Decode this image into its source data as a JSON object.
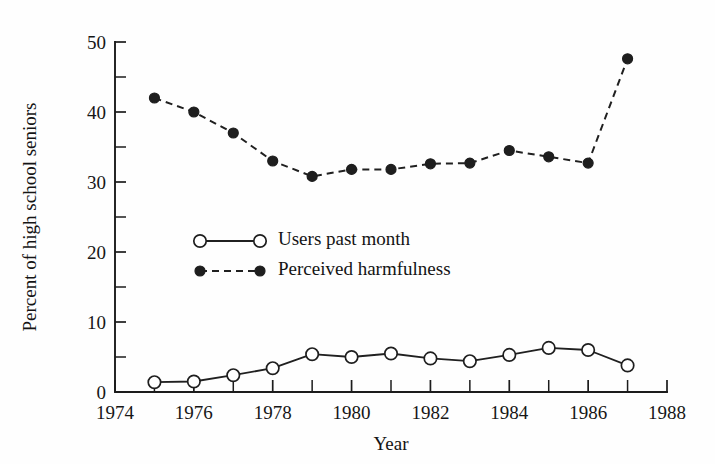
{
  "chart_data": {
    "type": "line",
    "title": "",
    "xlabel": "Year",
    "ylabel": "Percent of high school seniors",
    "xlim": [
      1974,
      1988
    ],
    "ylim": [
      0,
      50
    ],
    "grid": false,
    "legend_position": "center-left",
    "x_major_ticks": [
      1974,
      1976,
      1978,
      1980,
      1982,
      1984,
      1986,
      1988
    ],
    "x_minor_ticks": [
      1975,
      1977,
      1979,
      1981,
      1983,
      1985,
      1987
    ],
    "x_tick_labels": [
      "1974",
      "1976",
      "1978",
      "1980",
      "1982",
      "1984",
      "1986",
      "1988"
    ],
    "y_major_ticks": [
      0,
      10,
      20,
      30,
      40,
      50
    ],
    "y_minor_ticks": [
      5,
      15,
      25,
      35,
      45
    ],
    "y_tick_labels": [
      "0",
      "10",
      "20",
      "30",
      "40",
      "50"
    ],
    "x": [
      1975,
      1976,
      1977,
      1978,
      1979,
      1980,
      1981,
      1982,
      1983,
      1984,
      1985,
      1986,
      1987
    ],
    "series": [
      {
        "name": "Users past month",
        "marker": "open-circle",
        "linestyle": "solid",
        "color": "#1e1e1e",
        "values": [
          1.4,
          1.5,
          2.4,
          3.4,
          5.4,
          5.0,
          5.5,
          4.8,
          4.4,
          5.3,
          6.3,
          6.0,
          3.8
        ]
      },
      {
        "name": "Perceived harmfulness",
        "marker": "filled-circle",
        "linestyle": "dashed",
        "color": "#1e1e1e",
        "values": [
          42.0,
          40.0,
          37.0,
          33.0,
          30.8,
          31.8,
          31.8,
          32.6,
          32.7,
          34.5,
          33.6,
          32.7,
          47.6
        ]
      }
    ]
  },
  "legend": {
    "entries": [
      {
        "label": "Users past month"
      },
      {
        "label": "Perceived harmfulness"
      }
    ]
  }
}
